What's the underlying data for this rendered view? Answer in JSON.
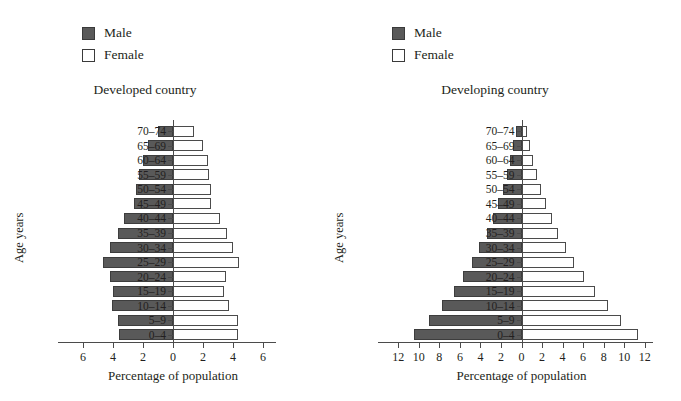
{
  "legend": {
    "male_label": "Male",
    "female_label": "Female",
    "male_color": "#595959",
    "female_color": "#ffffff"
  },
  "axis_titles": {
    "y": "Age years",
    "x": "Percentage of population"
  },
  "age_groups": [
    "0–4",
    "5–9",
    "10–14",
    "15–19",
    "20–24",
    "25–29",
    "30–34",
    "35–39",
    "40–44",
    "45–49",
    "50–54",
    "55–59",
    "60–64",
    "65–69",
    "70–74"
  ],
  "chart_data": [
    {
      "type": "bar",
      "subtype": "population-pyramid",
      "title": "Developed country",
      "xlabel": "Percentage of population",
      "ylabel": "Age years",
      "categories": [
        "0–4",
        "5–9",
        "10–14",
        "15–19",
        "20–24",
        "25–29",
        "30–34",
        "35–39",
        "40–44",
        "45–49",
        "50–54",
        "55–59",
        "60–64",
        "65–69",
        "70–74"
      ],
      "xticks": [
        6,
        4,
        2,
        0,
        2,
        4,
        6
      ],
      "xlim": [
        -7,
        7
      ],
      "grid": false,
      "legend_position": "above-left",
      "series": [
        {
          "name": "Male",
          "side": "left",
          "values": [
            3.6,
            3.7,
            4.1,
            4.0,
            4.2,
            4.7,
            4.2,
            3.7,
            3.3,
            2.6,
            2.5,
            2.3,
            2.0,
            1.7,
            1.0
          ]
        },
        {
          "name": "Female",
          "side": "right",
          "values": [
            4.3,
            4.3,
            3.7,
            3.4,
            3.5,
            4.4,
            4.0,
            3.6,
            3.1,
            2.5,
            2.5,
            2.4,
            2.3,
            2.0,
            1.4
          ]
        }
      ]
    },
    {
      "type": "bar",
      "subtype": "population-pyramid",
      "title": "Developing country",
      "xlabel": "Percentage of population",
      "ylabel": "Age years",
      "categories": [
        "0–4",
        "5–9",
        "10–14",
        "15–19",
        "20–24",
        "25–29",
        "30–34",
        "35–39",
        "40–44",
        "45–49",
        "50–54",
        "55–59",
        "60–64",
        "65–69",
        "70–74"
      ],
      "xticks": [
        12,
        10,
        8,
        6,
        4,
        2,
        0,
        2,
        4,
        6,
        8,
        10,
        12
      ],
      "xlim": [
        -13,
        13
      ],
      "grid": false,
      "legend_position": "above-left",
      "series": [
        {
          "name": "Male",
          "side": "left",
          "values": [
            10.5,
            9.0,
            7.7,
            6.6,
            5.7,
            4.8,
            4.1,
            3.4,
            2.8,
            2.3,
            1.8,
            1.4,
            1.1,
            0.8,
            0.5
          ]
        },
        {
          "name": "Female",
          "side": "right",
          "values": [
            11.3,
            9.7,
            8.4,
            7.2,
            6.1,
            5.1,
            4.3,
            3.6,
            3.0,
            2.4,
            1.9,
            1.5,
            1.1,
            0.8,
            0.5
          ]
        }
      ]
    }
  ]
}
